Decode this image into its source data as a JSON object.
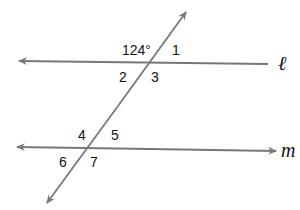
{
  "diagram": {
    "type": "parallel-lines-transversal",
    "lines": {
      "l": {
        "label": "ℓ",
        "y": 63
      },
      "m": {
        "label": "m",
        "y": 150
      }
    },
    "transversal": {
      "from": [
        47,
        203
      ],
      "to": [
        186,
        12
      ]
    },
    "angle_labels": {
      "given": "124°",
      "a1": "1",
      "a2": "2",
      "a3": "3",
      "a4": "4",
      "a5": "5",
      "a6": "6",
      "a7": "7"
    },
    "colors": {
      "line": "#777777",
      "text": "#111111",
      "background": "#ffffff"
    }
  }
}
